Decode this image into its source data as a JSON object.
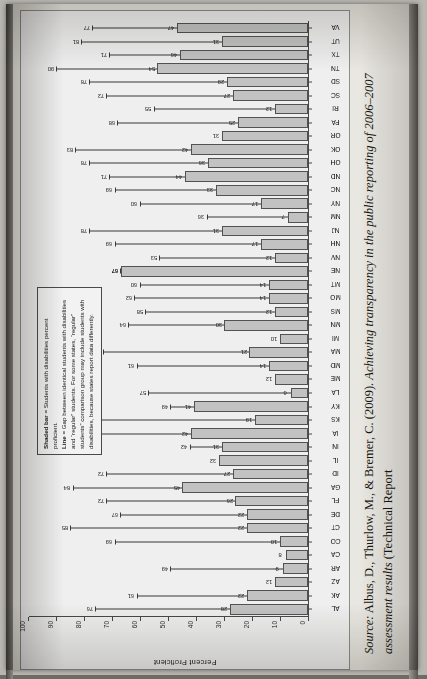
{
  "document": {
    "source_prefix": "Source:",
    "source_text": "Albus, D., Thurlow, M., & Bremer, C. (2009). Achieving transparency in the public reporting of 2006–2007 assessment results (Technical Report"
  },
  "legend": {
    "line1_bold": "Shaded bar",
    "line1_rest": " = Students with disabilities percent proficient.",
    "line2_bold": "Line",
    "line2_rest": " = Gap between identical students with disabilities and “regular” students. For some states, “regular” students” comparison group may include students with disabilities, because states report data differently."
  },
  "chart_data": {
    "type": "bar",
    "title": "",
    "xlabel": "",
    "ylabel": "Percent Proficient",
    "ylim": [
      0,
      100
    ],
    "yticks": [
      0,
      10,
      20,
      30,
      40,
      50,
      60,
      70,
      80,
      90,
      100
    ],
    "grid": false,
    "legend_position": "upper-right-inside",
    "categories": [
      "AL",
      "AK",
      "AZ",
      "AR",
      "CA",
      "CO",
      "CT",
      "DE",
      "FL",
      "GA",
      "ID",
      "IL",
      "IN",
      "IA",
      "KS",
      "KY",
      "LA",
      "ME",
      "MD",
      "MA",
      "MI",
      "MN",
      "MS",
      "MO",
      "MT",
      "NE",
      "NV",
      "NH",
      "NJ",
      "NM",
      "NY",
      "NC",
      "ND",
      "OH",
      "OK",
      "OR",
      "PA",
      "RI",
      "SC",
      "SD",
      "TN",
      "TX",
      "UT",
      "VA"
    ],
    "series": [
      {
        "name": "Students with disabilities percent proficient",
        "kind": "bar",
        "values": [
          28,
          22,
          12,
          9,
          8,
          10,
          22,
          22,
          26,
          45,
          27,
          32,
          31,
          42,
          19,
          41,
          6,
          12,
          14,
          21,
          10,
          30,
          12,
          14,
          14,
          67,
          12,
          17,
          31,
          7,
          17,
          33,
          44,
          36,
          42,
          31,
          25,
          12,
          27,
          29,
          54,
          46,
          31,
          47
        ]
      },
      {
        "name": "Gap between students with disabilities and regular students",
        "kind": "line",
        "values": [
          76,
          61,
          null,
          49,
          null,
          69,
          85,
          67,
          72,
          84,
          72,
          null,
          42,
          77,
          75,
          49,
          57,
          null,
          61,
          73,
          null,
          64,
          58,
          62,
          60,
          67,
          53,
          69,
          78,
          36,
          60,
          69,
          71,
          78,
          83,
          null,
          68,
          55,
          72,
          78,
          90,
          71,
          81,
          77
        ]
      }
    ]
  }
}
